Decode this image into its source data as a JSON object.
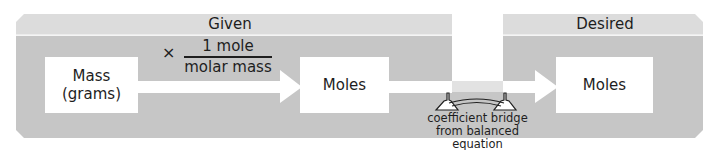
{
  "colors": {
    "header_band": "#dcdcdc",
    "panel_body": "#c6c6c6",
    "box_fill": "#ffffff",
    "arrow": "#ffffff",
    "bridge_strip": "#e2e2e2",
    "text": "#1e1e1e"
  },
  "given_panel": {
    "label": "Given",
    "source_box": {
      "line1": "Mass",
      "line2": "(grams)"
    },
    "conversion": {
      "operator": "×",
      "numerator": "1 mole",
      "denominator": "molar mass"
    },
    "target_box": {
      "label": "Moles"
    }
  },
  "bridge": {
    "icon": "bridge-icon",
    "caption_line1": "coefficient bridge",
    "caption_line2": "from balanced equation"
  },
  "desired_panel": {
    "label": "Desired",
    "box": {
      "label": "Moles"
    }
  }
}
